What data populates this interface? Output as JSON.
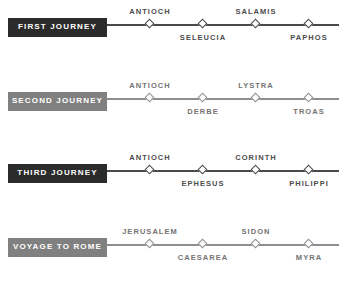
{
  "chart_data": {
    "type": "timeline",
    "orientation": "horizontal",
    "journeys": [
      {
        "label": "FIRST JOURNEY",
        "style": "dark",
        "accent": "#2b2b2b",
        "line_color": "#4a4a4a",
        "stops": [
          {
            "name": "ANTIOCH",
            "x": 150,
            "position": "above"
          },
          {
            "name": "SELEUCIA",
            "x": 203,
            "position": "below"
          },
          {
            "name": "SALAMIS",
            "x": 256,
            "position": "above"
          },
          {
            "name": "PAPHOS",
            "x": 309,
            "position": "below"
          }
        ]
      },
      {
        "label": "SECOND JOURNEY",
        "style": "light",
        "accent": "#808080",
        "line_color": "#8e8e8e",
        "stops": [
          {
            "name": "ANTIOCH",
            "x": 150,
            "position": "above"
          },
          {
            "name": "DERBE",
            "x": 203,
            "position": "below"
          },
          {
            "name": "LYSTRA",
            "x": 256,
            "position": "above"
          },
          {
            "name": "TROAS",
            "x": 309,
            "position": "below"
          }
        ]
      },
      {
        "label": "THIRD JOURNEY",
        "style": "dark",
        "accent": "#2b2b2b",
        "line_color": "#4a4a4a",
        "stops": [
          {
            "name": "ANTIOCH",
            "x": 150,
            "position": "above"
          },
          {
            "name": "EPHESUS",
            "x": 203,
            "position": "below"
          },
          {
            "name": "CORINTH",
            "x": 256,
            "position": "above"
          },
          {
            "name": "PHILIPPI",
            "x": 309,
            "position": "below"
          }
        ]
      },
      {
        "label": "VOYAGE TO ROME",
        "style": "light",
        "accent": "#808080",
        "line_color": "#8e8e8e",
        "stops": [
          {
            "name": "JERUSALEM",
            "x": 150,
            "position": "above"
          },
          {
            "name": "CAESAREA",
            "x": 203,
            "position": "below"
          },
          {
            "name": "SIDON",
            "x": 256,
            "position": "above"
          },
          {
            "name": "MYRA",
            "x": 309,
            "position": "below"
          }
        ]
      }
    ]
  }
}
